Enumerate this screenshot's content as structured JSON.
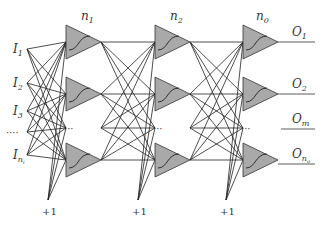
{
  "diagram": {
    "type": "feed-forward neural network",
    "layers": [
      {
        "label": "n",
        "sub": "1"
      },
      {
        "label": "n",
        "sub": "2"
      },
      {
        "label": "n",
        "sub": "0"
      }
    ],
    "inputs": [
      {
        "label": "I",
        "sub": "1"
      },
      {
        "label": "I",
        "sub": "2"
      },
      {
        "label": "I",
        "sub": "3"
      },
      {
        "label": "I",
        "sub": "n",
        "subsub": "i"
      }
    ],
    "outputs": [
      {
        "label": "O",
        "sub": "1"
      },
      {
        "label": "O",
        "sub": "2"
      },
      {
        "label": "O",
        "sub": "m"
      },
      {
        "label": "O",
        "sub": "n",
        "subsub": "o"
      }
    ],
    "bias_label": "+1",
    "ellipsis": "……",
    "colors": {
      "neuron_fill": "#a9a9a9",
      "line": "#222222"
    }
  }
}
